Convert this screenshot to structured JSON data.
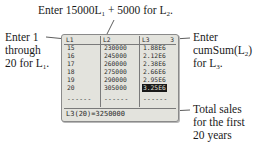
{
  "annotations": {
    "top": {
      "pre": "Enter 15000L",
      "sub1": "1",
      "mid": " + 5000 for L",
      "sub2": "2",
      "post": "."
    },
    "left": {
      "line1": "Enter 1",
      "line2": "through",
      "line3_pre": "20 for L",
      "line3_sub": "1",
      "line3_post": "."
    },
    "right": {
      "line1": "Enter",
      "line2_pre": "cumSum(L",
      "line2_sub": "2",
      "line2_post": ")",
      "line3_pre": "for L",
      "line3_sub": "3",
      "line3_post": "."
    },
    "bottom": {
      "line1": "Total sales",
      "line2": "for the first",
      "line3": "20 years"
    }
  },
  "calculator": {
    "headers": [
      "L1",
      "L2",
      "L3"
    ],
    "column_number": "3",
    "L1": [
      "15",
      "16",
      "17",
      "18",
      "19",
      "20"
    ],
    "L2": [
      "230000",
      "245000",
      "260000",
      "275000",
      "290000",
      "305000"
    ],
    "L3": [
      "1.88E6",
      "2.12E6",
      "2.38E6",
      "2.66E6",
      "2.95E6",
      "3.25E6"
    ],
    "dashes": "------",
    "status": "L3(20)=3250000",
    "selected_cell": "L3 row 20"
  }
}
